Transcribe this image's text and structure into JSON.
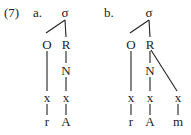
{
  "example_number": "(7)",
  "trees": [
    {
      "label": "a.",
      "root": "σ",
      "onset": "O",
      "rime": "R",
      "nucleus": "N",
      "timing_slots": [
        "x",
        "x"
      ],
      "segments": [
        "r",
        "A"
      ]
    },
    {
      "label": "b.",
      "root": "σ",
      "onset": "O",
      "rime": "R",
      "nucleus": "N",
      "timing_slots": [
        "x",
        "x",
        "x"
      ],
      "segments": [
        "r",
        "A",
        "m"
      ]
    }
  ]
}
